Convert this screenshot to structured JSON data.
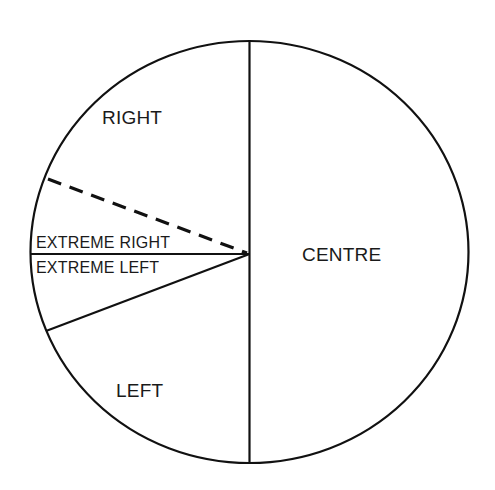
{
  "diagram": {
    "type": "pie-segment-diagram",
    "stroke_color": "#111111",
    "background_color": "#ffffff",
    "segments": [
      {
        "id": "right",
        "label": "RIGHT",
        "position": "upper-left"
      },
      {
        "id": "extreme-right",
        "label": "EXTREME RIGHT",
        "position": "left, above horizontal line"
      },
      {
        "id": "extreme-left",
        "label": "EXTREME LEFT",
        "position": "left, below horizontal line"
      },
      {
        "id": "left",
        "label": "LEFT",
        "position": "lower-left"
      },
      {
        "id": "centre",
        "label": "CENTRE",
        "position": "right half"
      }
    ],
    "dividers": [
      {
        "id": "vertical-divider",
        "style": "solid",
        "from": "top",
        "to": "bottom"
      },
      {
        "id": "horizontal-divider",
        "style": "solid",
        "from": "left edge",
        "to": "center"
      },
      {
        "id": "lower-left-divider",
        "style": "solid",
        "from": "lower-left edge",
        "to": "center"
      },
      {
        "id": "dashed-divider",
        "style": "dashed",
        "from": "upper-left edge",
        "to": "center"
      }
    ]
  },
  "labels": {
    "right": "RIGHT",
    "centre": "CENTRE",
    "left": "LEFT",
    "extreme_right": "EXTREME RIGHT",
    "extreme_left": "EXTREME LEFT"
  }
}
